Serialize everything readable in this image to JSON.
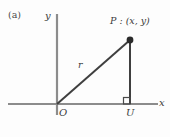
{
  "figure": {
    "panel_label": "(a)",
    "axes": {
      "y_label": "y",
      "x_label": "x"
    },
    "points": {
      "origin_label": "O",
      "foot_label": "U",
      "point_label": "P : (x, y)"
    },
    "segments": {
      "radius_label": "r"
    },
    "markers": {
      "right_angle": "right-angle-square"
    },
    "colors": {
      "axis": "#8c8c8c",
      "line": "#3f3f3f",
      "text": "#3b3b3b",
      "background": "#fdfdfd",
      "point_fill": "#2b2b2b"
    }
  }
}
